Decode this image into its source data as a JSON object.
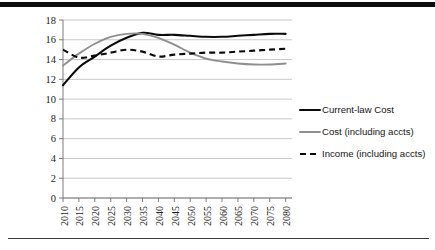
{
  "chart_data": {
    "type": "line",
    "title": "",
    "subtitle": "",
    "xlabel": "",
    "ylabel": "",
    "xlim": [
      2010,
      2082
    ],
    "ylim": [
      0,
      18
    ],
    "ytick_step": 2,
    "grid": true,
    "legend_position": "right",
    "x": [
      2010,
      2015,
      2020,
      2025,
      2030,
      2035,
      2040,
      2045,
      2050,
      2055,
      2060,
      2065,
      2070,
      2075,
      2080
    ],
    "xtick_labels": [
      "2010",
      "2015",
      "2020",
      "2025",
      "2030",
      "2035",
      "2040",
      "2045",
      "2050",
      "2055",
      "2060",
      "2065",
      "2070",
      "2075",
      "2080"
    ],
    "ytick_labels": [
      "0",
      "2",
      "4",
      "6",
      "8",
      "10",
      "12",
      "14",
      "16",
      "18"
    ],
    "ytick_values": [
      0,
      2,
      4,
      6,
      8,
      10,
      12,
      14,
      16,
      18
    ],
    "series": [
      {
        "name": "Current-law Cost",
        "style": "solid",
        "color": "#0a0a0a",
        "values": [
          11.4,
          13.2,
          14.3,
          15.4,
          16.2,
          16.7,
          16.5,
          16.5,
          16.4,
          16.3,
          16.3,
          16.4,
          16.5,
          16.6,
          16.6
        ]
      },
      {
        "name": "Cost (including accts)",
        "style": "solid",
        "color": "#8f8f8f",
        "values": [
          13.4,
          14.6,
          15.6,
          16.3,
          16.6,
          16.6,
          16.2,
          15.5,
          14.7,
          14.1,
          13.8,
          13.6,
          13.5,
          13.5,
          13.6
        ]
      },
      {
        "name": "Income (including accts)",
        "style": "dashed",
        "color": "#0a0a0a",
        "values": [
          15.0,
          14.2,
          14.4,
          14.7,
          15.0,
          14.8,
          14.3,
          14.5,
          14.6,
          14.7,
          14.7,
          14.8,
          14.9,
          15.0,
          15.1
        ]
      }
    ]
  },
  "legend": {
    "items": [
      {
        "label": "Current-law Cost"
      },
      {
        "label": "Cost (including accts)"
      },
      {
        "label": "Income (including accts)"
      }
    ]
  }
}
